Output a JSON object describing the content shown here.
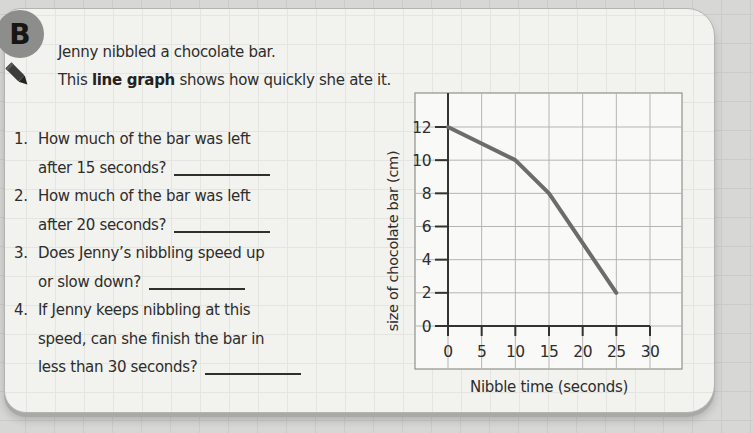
{
  "worksheet": {
    "badge": "B",
    "intro_line1": "Jenny nibbled a chocolate bar.",
    "intro_line2_pre": "This ",
    "intro_line2_bold": "line graph",
    "intro_line2_post": " shows how quickly she ate it."
  },
  "questions": [
    {
      "num": "1.",
      "lines": [
        "How much of the bar was left",
        "after 15 seconds?"
      ]
    },
    {
      "num": "2.",
      "lines": [
        "How much of the bar was left",
        "after 20 seconds?"
      ]
    },
    {
      "num": "3.",
      "lines": [
        "Does Jenny’s nibbling speed up",
        "or slow down?"
      ]
    },
    {
      "num": "4.",
      "lines": [
        "If Jenny keeps nibbling at this",
        "speed, can she finish the bar in",
        "less than 30 seconds?"
      ]
    }
  ],
  "chart_data": {
    "type": "line",
    "x": [
      0,
      10,
      15,
      25
    ],
    "y": [
      12,
      10,
      8,
      2
    ],
    "xlabel": "Nibble time (seconds)",
    "ylabel": "size of chocolate bar (cm)",
    "x_ticks": [
      0,
      5,
      10,
      15,
      20,
      25,
      30
    ],
    "y_ticks": [
      0,
      2,
      4,
      6,
      8,
      10,
      12
    ],
    "xlim": [
      0,
      35
    ],
    "ylim": [
      0,
      14
    ],
    "grid": true,
    "legend": false,
    "line_color": "#6c6c6c"
  },
  "colors": {
    "page_bg": "#d7d7d5",
    "card_bg": "#f2f2ef",
    "plot_bg": "#f9f9f7",
    "grid_line": "#b5b5b2",
    "axis": "#333331",
    "text": "#2d2d2b",
    "badge_bg": "#8d8d8b",
    "data_line": "#6c6c6c"
  }
}
